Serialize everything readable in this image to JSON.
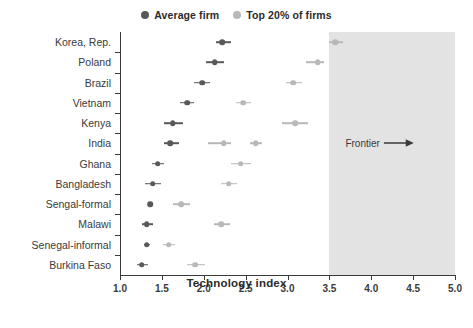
{
  "chart_data": {
    "type": "scatter",
    "title": "",
    "xlabel": "Technology index",
    "ylabel": "",
    "xlim": [
      1.0,
      5.0
    ],
    "xticks": [
      "1.0",
      "1.5",
      "2.0",
      "2.5",
      "3.0",
      "3.5",
      "4.0",
      "4.5",
      "5.0"
    ],
    "grid": false,
    "legend_position": "top-center",
    "legend": [
      {
        "name": "Average firm",
        "color": "#595959"
      },
      {
        "name": "Top 20% of firms",
        "color": "#b8b8b8"
      }
    ],
    "annotations": [
      {
        "text": "Frontier",
        "arrow": "→",
        "x": 4.1,
        "category": "India"
      }
    ],
    "shaded_region": {
      "label": "Frontier",
      "from": 3.5,
      "to": 5.0,
      "color": "#e3e3e3"
    },
    "categories": [
      "Korea, Rep.",
      "Poland",
      "Brazil",
      "Vietnam",
      "Kenya",
      "India",
      "Ghana",
      "Bangladesh",
      "Sengal-formal",
      "Malawi",
      "Senegal-informal",
      "Burkina Faso"
    ],
    "series": [
      {
        "name": "Average firm",
        "color": "#595959",
        "values": [
          2.22,
          2.13,
          1.98,
          1.8,
          1.63,
          1.6,
          1.45,
          1.39,
          1.36,
          1.32,
          1.32,
          1.26
        ],
        "ci_low": [
          2.15,
          2.03,
          1.88,
          1.72,
          1.53,
          1.52,
          1.38,
          1.3,
          1.33,
          1.26,
          1.29,
          1.2
        ],
        "ci_high": [
          2.32,
          2.24,
          2.08,
          1.88,
          1.75,
          1.7,
          1.53,
          1.49,
          1.4,
          1.39,
          1.36,
          1.34
        ]
      },
      {
        "name": "Top 20% of firms",
        "color": "#b8b8b8",
        "values": [
          3.57,
          3.36,
          3.07,
          2.47,
          3.09,
          2.62,
          2.44,
          2.3,
          1.73,
          2.21,
          1.58,
          1.9
        ],
        "ci_low": [
          3.5,
          3.22,
          2.98,
          2.39,
          2.93,
          2.55,
          2.33,
          2.21,
          1.63,
          2.12,
          1.51,
          1.8
        ],
        "ci_high": [
          3.66,
          3.44,
          3.17,
          2.56,
          3.25,
          2.7,
          2.56,
          2.4,
          1.84,
          2.31,
          1.66,
          2.02
        ]
      },
      {
        "name": "Top 20% of firms (secondary)",
        "color": "#b8b8b8",
        "values": [
          null,
          null,
          null,
          null,
          null,
          2.24,
          null,
          null,
          null,
          null,
          null,
          null
        ],
        "ci_low": [
          null,
          null,
          null,
          null,
          null,
          2.05,
          null,
          null,
          null,
          null,
          null,
          null
        ],
        "ci_high": [
          null,
          null,
          null,
          null,
          null,
          2.33,
          null,
          null,
          null,
          null,
          null,
          null
        ]
      }
    ]
  }
}
